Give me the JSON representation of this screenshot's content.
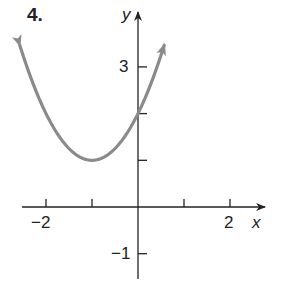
{
  "problem_number": "4.",
  "chart_data": {
    "type": "line",
    "title": "",
    "xlabel": "x",
    "ylabel": "y",
    "x_tick_labels": [
      {
        "value": -2,
        "label": "−2"
      },
      {
        "value": 2,
        "label": "2"
      }
    ],
    "y_tick_labels": [
      {
        "value": 3,
        "label": "3"
      },
      {
        "value": -1,
        "label": "−1"
      }
    ],
    "x_ticks": [
      -2,
      -1,
      1,
      2
    ],
    "y_ticks": [
      -1,
      1,
      2,
      3
    ],
    "xlim": [
      -2.6,
      2.9
    ],
    "ylim": [
      -1.55,
      3.75
    ],
    "grid": false,
    "legend": null,
    "curve_color": "#8a8a8a",
    "axis_color": "#222222",
    "series": [
      {
        "name": "parabola",
        "description": "Upward-opening parabola with vertex (-1, 1), y-intercept (0, 2), arrows at both ends",
        "vertex": [
          -1,
          1
        ],
        "equation": "y = (x + 1)^2 + 1",
        "x": [
          -2.57,
          -2.5,
          -2,
          -1.5,
          -1,
          -0.5,
          0,
          0.5,
          0.57
        ],
        "y": [
          3.46,
          3.25,
          2,
          1.25,
          1,
          1.25,
          2,
          3.25,
          3.46
        ]
      }
    ]
  }
}
